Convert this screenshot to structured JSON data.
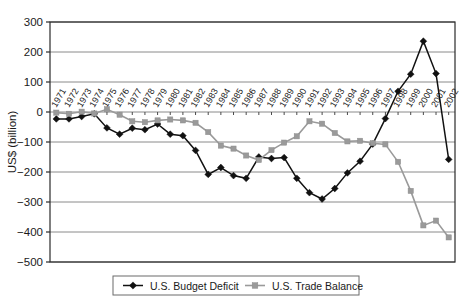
{
  "chart_data": {
    "type": "line",
    "title": "",
    "xlabel": "",
    "ylabel": "US$ (billion)",
    "ylim": [
      -500,
      300
    ],
    "ytick_step": 100,
    "yticks": [
      "300",
      "200",
      "100",
      "0",
      "-100",
      "-200",
      "-300",
      "-400",
      "-500"
    ],
    "grid": true,
    "legend_position": "bottom",
    "colors": {
      "deficit": "#111111",
      "trade": "#9a9a9a",
      "grid": "#8a8a8a",
      "axis": "#2b2b2b",
      "background": "#ffffff"
    },
    "categories": [
      "1971",
      "1972",
      "1973",
      "1974",
      "1975",
      "1976",
      "1977",
      "1978",
      "1979",
      "1980",
      "1981",
      "1982",
      "1983",
      "1984",
      "1985",
      "1986",
      "1987",
      "1988",
      "1989",
      "1990",
      "1991",
      "1992",
      "1993",
      "1994",
      "1995",
      "1996",
      "1997",
      "1998",
      "1999",
      "2000",
      "2001",
      "2002"
    ],
    "series": [
      {
        "name": "U.S. Budget Deficit",
        "marker": "diamond",
        "color": "#111111",
        "values": [
          -23,
          -23,
          -15,
          -6,
          -53,
          -74,
          -54,
          -59,
          -40,
          -74,
          -79,
          -128,
          -208,
          -185,
          -212,
          -221,
          -150,
          -155,
          -152,
          -221,
          -269,
          -290,
          -255,
          -203,
          -164,
          -107,
          -22,
          69,
          126,
          236,
          128,
          -158
        ]
      },
      {
        "name": "U.S. Trade Balance",
        "marker": "square",
        "color": "#9a9a9a",
        "values": [
          -2,
          -6,
          1,
          -5,
          9,
          -9,
          -31,
          -34,
          -28,
          -25,
          -28,
          -36,
          -67,
          -112,
          -122,
          -145,
          -160,
          -127,
          -102,
          -81,
          -31,
          -39,
          -70,
          -98,
          -96,
          -104,
          -108,
          -166,
          -263,
          -378,
          -362,
          -418
        ]
      }
    ],
    "legend": [
      {
        "label": "U.S. Budget Deficit",
        "marker": "diamond",
        "color": "#111111"
      },
      {
        "label": "U.S. Trade Balance",
        "marker": "square",
        "color": "#9a9a9a"
      }
    ]
  }
}
